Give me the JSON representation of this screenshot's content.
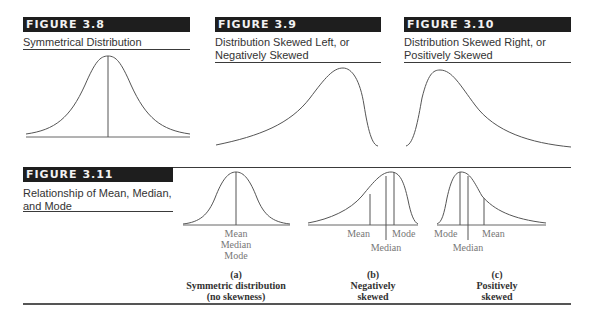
{
  "figures": [
    {
      "id": "fig-3-8",
      "label": "FIGURE 3.8",
      "caption_lines": [
        "Symmetrical Distribution"
      ]
    },
    {
      "id": "fig-3-9",
      "label": "FIGURE 3.9",
      "caption_lines": [
        "Distribution Skewed Left, or",
        "Negatively Skewed"
      ]
    },
    {
      "id": "fig-3-10",
      "label": "FIGURE 3.10",
      "caption_lines": [
        "Distribution Skewed Right, or",
        "Positively Skewed"
      ]
    },
    {
      "id": "fig-3-11",
      "label": "FIGURE 3.11",
      "caption_lines": [
        "Relationship of Mean, Median,",
        "and Mode"
      ]
    }
  ],
  "panels": [
    {
      "letter": "(a)",
      "title_lines": [
        "Symmetric distribution",
        "(no skewness)"
      ],
      "labels": [
        "Mean",
        "Median",
        "Mode"
      ]
    },
    {
      "letter": "(b)",
      "title_lines": [
        "Negatively",
        "skewed"
      ],
      "labels": {
        "left": "Mean",
        "middle": "Median",
        "right": "Mode"
      }
    },
    {
      "letter": "(c)",
      "title_lines": [
        "Positively",
        "skewed"
      ],
      "labels": {
        "left": "Mode",
        "middle": "Median",
        "right": "Mean"
      }
    }
  ],
  "colors": {
    "bar": "#1e1e1e",
    "curve": "#555555",
    "label": "#777777",
    "rule": "#3a3a3a"
  }
}
